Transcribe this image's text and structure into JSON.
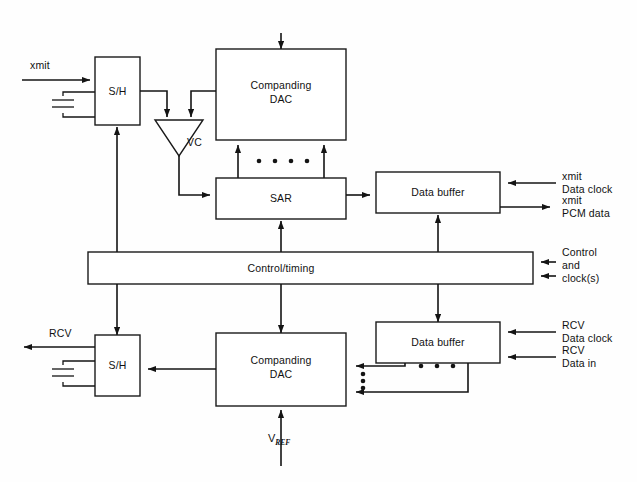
{
  "diagram": {
    "type": "block-diagram",
    "background_color": "#ffffff",
    "line_color": "#141414",
    "blocks": {
      "sh_xmit": {
        "label": "S/H"
      },
      "companding_dac_xmit": {
        "label_line1": "Companding",
        "label_line2": "DAC"
      },
      "sar": {
        "label": "SAR"
      },
      "data_buffer_xmit": {
        "label": "Data buffer"
      },
      "control_timing": {
        "label": "Control/timing"
      },
      "data_buffer_rcv": {
        "label": "Data buffer"
      },
      "companding_dac_rcv": {
        "label_line1": "Companding",
        "label_line2": "DAC"
      },
      "sh_rcv": {
        "label": "S/H"
      },
      "comparator": {
        "label": "VC"
      }
    },
    "signals": {
      "xmit_in": "xmit",
      "rcv_out": "RCV",
      "xmit_data_clock_l1": "xmit",
      "xmit_data_clock_l2": "Data clock",
      "xmit_pcm_data_l1": "xmit",
      "xmit_pcm_data_l2": "PCM data",
      "control_l1": "Control",
      "control_l2": "and",
      "control_l3": "clock(s)",
      "rcv_data_clock_l1": "RCV",
      "rcv_data_clock_l2": "Data clock",
      "rcv_data_in_l1": "RCV",
      "rcv_data_in_l2": "Data in",
      "vref_main": "V",
      "vref_sub": "REF"
    }
  }
}
